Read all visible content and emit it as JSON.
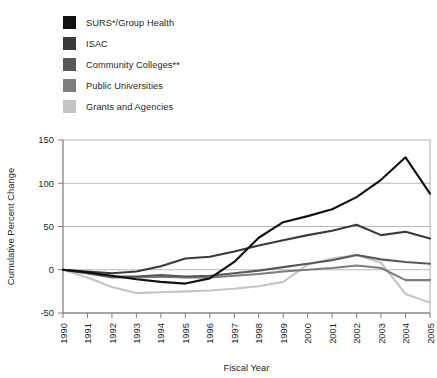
{
  "chart_data": {
    "type": "line",
    "title": "",
    "xlabel": "Fiscal Year",
    "ylabel": "Cumulative Percent Change",
    "x": [
      1990,
      1991,
      1992,
      1993,
      1994,
      1995,
      1996,
      1997,
      1998,
      1999,
      2000,
      2001,
      2002,
      2003,
      2004,
      2005
    ],
    "xtick_labels": [
      "1990",
      "1991",
      "1992",
      "1993",
      "1994",
      "1995",
      "1996",
      "1997",
      "1998",
      "1999",
      "2000",
      "2001",
      "2002",
      "2003",
      "2004",
      "2005"
    ],
    "ytick_labels": [
      "150",
      "100",
      "50",
      "0",
      "-50"
    ],
    "yticks": [
      150,
      100,
      50,
      0,
      -50
    ],
    "ylim": [
      -50,
      150
    ],
    "grid": "horizontal",
    "legend_position": "above-plot",
    "series": [
      {
        "name": "SURS*/Group Health",
        "color": "#111111",
        "values": [
          0,
          -3,
          -7,
          -11,
          -14,
          -16,
          -10,
          9,
          37,
          55,
          62,
          70,
          84,
          104,
          130,
          88
        ]
      },
      {
        "name": "ISAC",
        "color": "#3a3a3a",
        "values": [
          0,
          -2,
          -4,
          -2,
          4,
          13,
          15,
          21,
          28,
          34,
          40,
          45,
          52,
          40,
          44,
          36
        ]
      },
      {
        "name": "Community Colleges**",
        "color": "#585858",
        "values": [
          0,
          -4,
          -8,
          -8,
          -6,
          -8,
          -7,
          -4,
          -1,
          3,
          7,
          11,
          17,
          12,
          9,
          7
        ]
      },
      {
        "name": "Public Universities",
        "color": "#7d7d7d",
        "values": [
          0,
          -4,
          -9,
          -9,
          -8,
          -9,
          -9,
          -7,
          -5,
          -2,
          0,
          2,
          5,
          2,
          -12,
          -12
        ]
      },
      {
        "name": "Grants and Agencies",
        "color": "#c4c4c4",
        "values": [
          0,
          -9,
          -20,
          -27,
          -26,
          -25,
          -24,
          -22,
          -19,
          -14,
          6,
          13,
          17,
          8,
          -28,
          -38
        ]
      }
    ]
  },
  "legend": {
    "items": [
      {
        "label": "SURS*/Group Health",
        "color": "#111111"
      },
      {
        "label": "ISAC",
        "color": "#3a3a3a"
      },
      {
        "label": "Community Colleges**",
        "color": "#585858"
      },
      {
        "label": "Public Universities",
        "color": "#7d7d7d"
      },
      {
        "label": "Grants and Agencies",
        "color": "#c4c4c4"
      }
    ]
  },
  "axes": {
    "y_title": "Cumulative Percent Change",
    "x_title": "Fiscal Year"
  }
}
